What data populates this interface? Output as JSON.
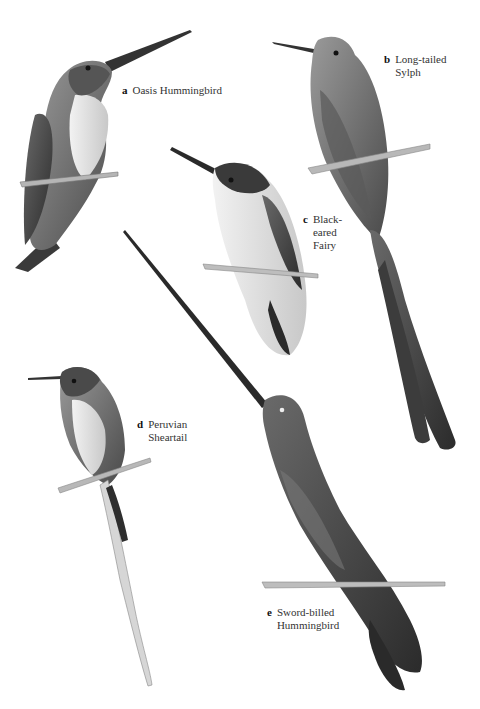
{
  "plate": {
    "background": "#ffffff",
    "species": [
      {
        "letter": "a",
        "name_lines": [
          "Oasis Hummingbird"
        ]
      },
      {
        "letter": "b",
        "name_lines": [
          "Long-tailed",
          "Sylph"
        ]
      },
      {
        "letter": "c",
        "name_lines": [
          "Black-",
          "eared",
          "Fairy"
        ]
      },
      {
        "letter": "d",
        "name_lines": [
          "Peruvian",
          "Sheartail"
        ]
      },
      {
        "letter": "e",
        "name_lines": [
          "Sword-billed",
          "Hummingbird"
        ]
      }
    ]
  }
}
